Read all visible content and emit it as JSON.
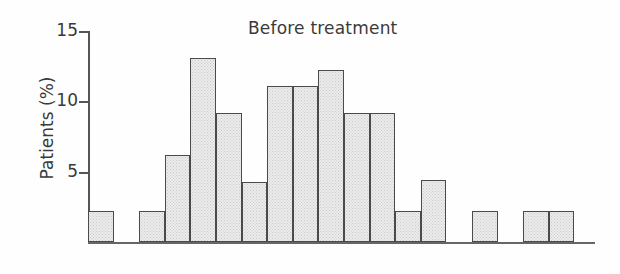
{
  "chart_data": {
    "type": "bar",
    "title": "Before treatment",
    "xlabel": "",
    "ylabel": "Patients (%)",
    "ylim": [
      0,
      15
    ],
    "yticks": [
      5,
      10,
      15
    ],
    "ytick_labels": [
      "5",
      "10",
      "15"
    ],
    "grid": false,
    "legend": false,
    "categories": [
      "1",
      "2",
      "3",
      "4",
      "5",
      "6",
      "7",
      "8",
      "9",
      "10",
      "11",
      "12",
      "13",
      "14",
      "15",
      "16",
      "17",
      "18",
      "19"
    ],
    "values": [
      2.2,
      0,
      2.2,
      6.2,
      13.1,
      9.2,
      4.3,
      11.1,
      11.1,
      12.2,
      9.2,
      9.2,
      2.2,
      4.4,
      0,
      2.2,
      0,
      2.2,
      2.2
    ],
    "bar_fill": "#ececec",
    "bar_edge": "#4a4a4a",
    "axis_color": "#555555",
    "series": [
      {
        "name": "Before treatment",
        "values": [
          2.2,
          0,
          2.2,
          6.2,
          13.1,
          9.2,
          4.3,
          11.1,
          11.1,
          12.2,
          9.2,
          9.2,
          2.2,
          4.4,
          0,
          2.2,
          0,
          2.2,
          2.2
        ]
      }
    ]
  },
  "axis": {
    "ylabel": "Patients (%)",
    "tick_15": "15",
    "tick_10": "10",
    "tick_5": "5"
  },
  "title": {
    "text": "Before treatment"
  }
}
